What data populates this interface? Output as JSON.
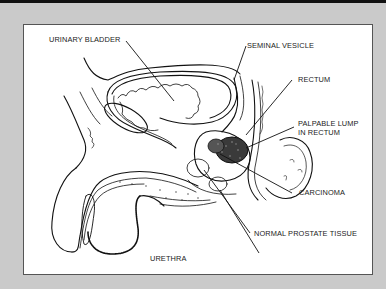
{
  "figure": {
    "frame_color": "#cacaca",
    "panel_color": "#ffffff",
    "topbar_color": "#111111",
    "labels": {
      "urinary_bladder": "URINARY BLADDER",
      "seminal_vesicle": "SEMINAL VESICLE",
      "rectum": "RECTUM",
      "palpable_lump_line1": "PALPABLE LUMP",
      "palpable_lump_line2": "IN RECTUM",
      "carcinoma": "CARCINOMA",
      "normal_prostate_tissue": "NORMAL PROSTATE TISSUE",
      "urethra": "URETHRA"
    }
  }
}
